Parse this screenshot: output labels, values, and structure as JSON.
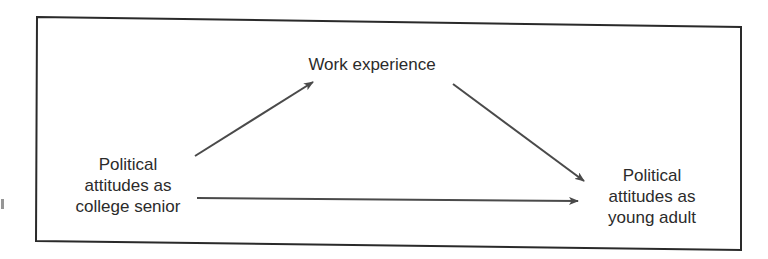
{
  "diagram": {
    "type": "path-diagram",
    "frame": {
      "border_color": "#2a2a2a"
    },
    "nodes": [
      {
        "id": "work",
        "lines": [
          "Work experience"
        ]
      },
      {
        "id": "senior",
        "lines": [
          "Political",
          "attitudes as",
          "college senior"
        ]
      },
      {
        "id": "adult",
        "lines": [
          "Political",
          "attitudes as",
          "young adult"
        ]
      }
    ],
    "edges": [
      {
        "from": "senior",
        "to": "work"
      },
      {
        "from": "work",
        "to": "adult"
      },
      {
        "from": "senior",
        "to": "adult"
      }
    ],
    "colors": {
      "arrow": "#4a4a4a",
      "text": "#2b2b2b",
      "background": "#ffffff"
    }
  }
}
